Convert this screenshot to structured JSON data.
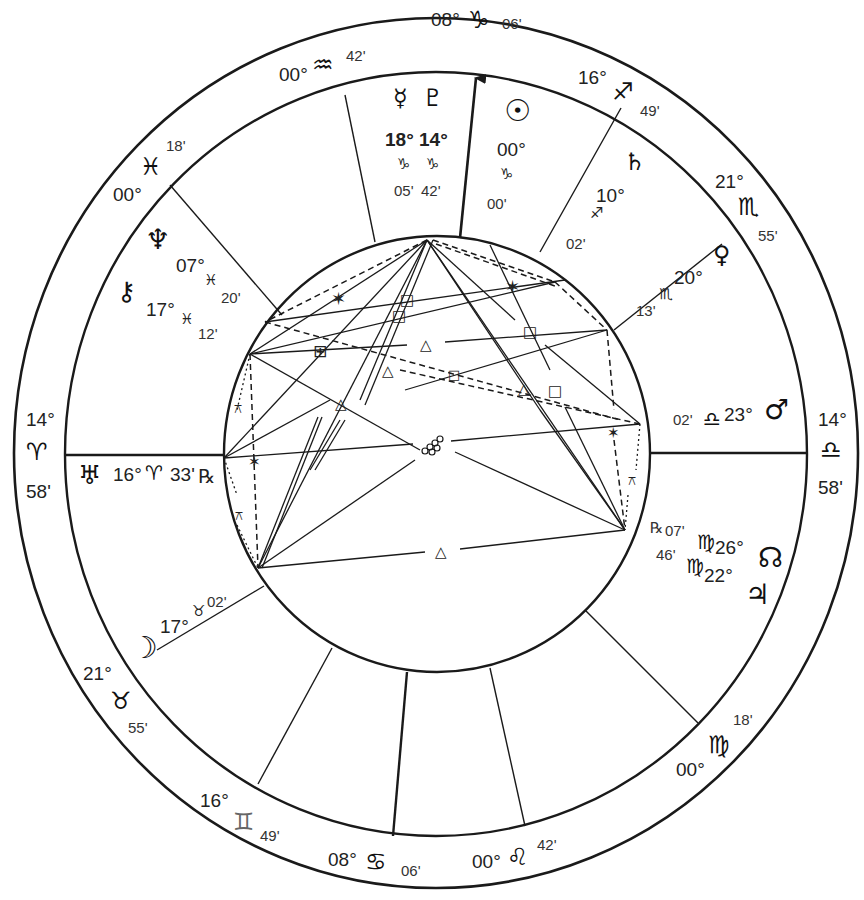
{
  "chart_type": "natal-wheel",
  "colors": {
    "line": "#1a1a1a",
    "background": "#ffffff"
  },
  "cusps": [
    {
      "id": "mc",
      "degree": "08°",
      "sign": "♑",
      "sign_name": "capricorn",
      "minutes": "06'"
    },
    {
      "id": "h11",
      "degree": "16°",
      "sign": "♐",
      "sign_name": "sagittarius",
      "minutes": "49'"
    },
    {
      "id": "h12",
      "degree": "21°",
      "sign": "♏",
      "sign_name": "scorpio",
      "minutes": "55'"
    },
    {
      "id": "dsc",
      "degree": "14°",
      "sign": "♎",
      "sign_name": "libra",
      "minutes": "58'"
    },
    {
      "id": "h6",
      "degree": "00°",
      "sign": "♍",
      "sign_name": "virgo",
      "minutes": "18'"
    },
    {
      "id": "h5",
      "degree": "00°",
      "sign": "♌",
      "sign_name": "leo",
      "minutes": "42'"
    },
    {
      "id": "ic",
      "degree": "08°",
      "sign": "♋",
      "sign_name": "cancer",
      "minutes": "06'"
    },
    {
      "id": "h3",
      "degree": "16°",
      "sign": "♊",
      "sign_name": "gemini",
      "minutes": "49'"
    },
    {
      "id": "h2",
      "degree": "21°",
      "sign": "♉",
      "sign_name": "taurus",
      "minutes": "55'"
    },
    {
      "id": "asc",
      "degree": "14°",
      "sign": "♈",
      "sign_name": "aries",
      "minutes": "58'"
    },
    {
      "id": "h12b",
      "degree": "00°",
      "sign": "♓",
      "sign_name": "pisces",
      "minutes": "18'"
    },
    {
      "id": "h11b",
      "degree": "00°",
      "sign": "♒",
      "sign_name": "aquarius",
      "minutes": "42'"
    }
  ],
  "planets": [
    {
      "name": "mercury",
      "glyph": "☿",
      "degree": "18°",
      "sign": "♑",
      "minutes": "05'"
    },
    {
      "name": "pluto",
      "glyph": "♇",
      "degree": "14°",
      "sign": "♑",
      "minutes": "42'"
    },
    {
      "name": "sun",
      "glyph": "☉",
      "degree": "00°",
      "sign": "♑",
      "minutes": "00'"
    },
    {
      "name": "saturn",
      "glyph": "♄",
      "degree": "10°",
      "sign": "♐",
      "minutes": "02'"
    },
    {
      "name": "venus",
      "glyph": "♀",
      "degree": "20°",
      "sign": "♏",
      "minutes": "13'"
    },
    {
      "name": "mars",
      "glyph": "♂",
      "degree": "23°",
      "sign": "♎",
      "minutes": "02'"
    },
    {
      "name": "north-node",
      "glyph": "☊",
      "degree": "26°",
      "sign": "♍",
      "minutes": "07'",
      "retro": "℞"
    },
    {
      "name": "jupiter",
      "glyph": "♃",
      "degree": "22°",
      "sign": "♍",
      "minutes": "46'"
    },
    {
      "name": "moon",
      "glyph": "☽",
      "degree": "17°",
      "sign": "♉",
      "minutes": "02'"
    },
    {
      "name": "uranus",
      "glyph": "♅",
      "degree": "16°",
      "sign": "♈",
      "minutes": "33'",
      "retro": "℞"
    },
    {
      "name": "neptune",
      "glyph": "♆",
      "degree": "07°",
      "sign": "♓",
      "minutes": "20'"
    },
    {
      "name": "chiron",
      "glyph": "⚷",
      "degree": "17°",
      "sign": "♓",
      "minutes": "12'"
    }
  ],
  "aspects": {
    "sextile": "✶",
    "square": "□",
    "trine": "△",
    "quincunx": "⚻",
    "opposition": "☍",
    "multi_square": "⊞"
  }
}
